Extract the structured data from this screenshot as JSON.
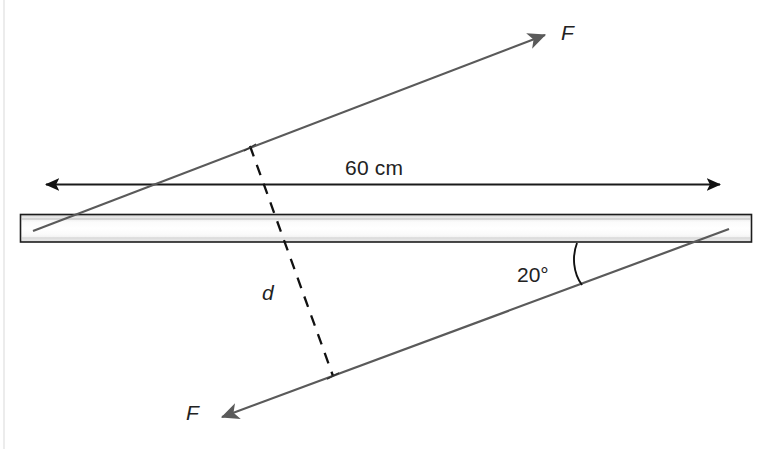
{
  "figure": {
    "background_color": "#ffffff",
    "line_color": "#5a5a5a",
    "outline_color": "#1a1a1a",
    "text_color": "#222222"
  },
  "labels": {
    "force_top": "F",
    "force_bottom": "F",
    "distance_perpendicular": "d",
    "bar_length": "60 cm",
    "angle": "20°"
  },
  "geometry": {
    "bar": {
      "x": 20,
      "y": 214,
      "width": 732,
      "height": 28
    },
    "dimension_line": {
      "y": 184,
      "x_start": 38,
      "x_end": 728
    },
    "force_top": {
      "x1": 33,
      "y1": 231,
      "x2": 551,
      "y2": 32
    },
    "force_bottom": {
      "x1": 729,
      "y1": 229,
      "x2": 216,
      "y2": 420
    },
    "dashed_d": {
      "x1": 250,
      "y1": 147,
      "x2": 333,
      "y2": 375
    },
    "angle_arc": {
      "x1": 577,
      "y1": 243,
      "x2": 582,
      "y2": 285
    }
  },
  "annotation_values": {
    "bar_length_value": "60",
    "bar_length_unit": "cm",
    "angle_value": "20",
    "angle_unit": "°"
  }
}
